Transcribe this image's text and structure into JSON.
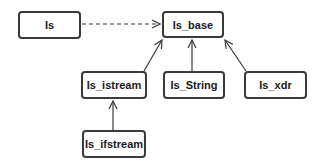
{
  "diagram": {
    "type": "class-hierarchy",
    "nodes": [
      {
        "id": "Is",
        "label": "Is",
        "x": 18,
        "y": 11,
        "w": 63,
        "h": 28
      },
      {
        "id": "Is_base",
        "label": "Is_base",
        "x": 162,
        "y": 11,
        "w": 62,
        "h": 27
      },
      {
        "id": "Is_istream",
        "label": "Is_istream",
        "x": 81,
        "y": 71,
        "w": 66,
        "h": 28
      },
      {
        "id": "Is_String",
        "label": "Is_String",
        "x": 163,
        "y": 71,
        "w": 62,
        "h": 28
      },
      {
        "id": "Is_xdr",
        "label": "Is_xdr",
        "x": 244,
        "y": 71,
        "w": 63,
        "h": 28
      },
      {
        "id": "Is_ifstream",
        "label": "Is_ifstream",
        "x": 82,
        "y": 130,
        "w": 64,
        "h": 28
      }
    ],
    "edges": [
      {
        "from": "Is",
        "to": "Is_base",
        "style": "dashed"
      },
      {
        "from": "Is_istream",
        "to": "Is_base",
        "style": "solid"
      },
      {
        "from": "Is_String",
        "to": "Is_base",
        "style": "solid"
      },
      {
        "from": "Is_xdr",
        "to": "Is_base",
        "style": "solid"
      },
      {
        "from": "Is_ifstream",
        "to": "Is_istream",
        "style": "solid"
      }
    ],
    "colors": {
      "stroke": "#3a3a3a",
      "text": "#1a1a1a",
      "background": "#ffffff"
    }
  }
}
